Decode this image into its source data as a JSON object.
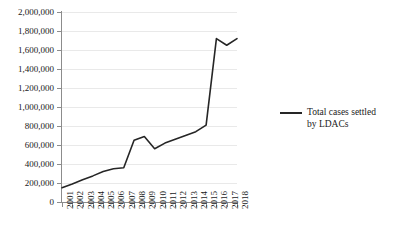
{
  "chart_data": {
    "type": "line",
    "title": "",
    "xlabel": "",
    "ylabel": "",
    "categories": [
      "2001",
      "2002",
      "2003",
      "2004",
      "2005",
      "2006",
      "2007",
      "2008",
      "2009",
      "2010",
      "2011",
      "2012",
      "2013",
      "2014",
      "2015",
      "2016",
      "2017",
      "2018"
    ],
    "series": [
      {
        "name": "Total cases settled by LDACs",
        "color": "#262626",
        "values": [
          150000,
          190000,
          235000,
          275000,
          320000,
          350000,
          360000,
          650000,
          690000,
          560000,
          620000,
          660000,
          700000,
          740000,
          810000,
          1720000,
          1650000,
          1720000
        ]
      }
    ],
    "ylim": [
      0,
      2000000
    ],
    "ytick_values": [
      0,
      200000,
      400000,
      600000,
      800000,
      1000000,
      1200000,
      1400000,
      1600000,
      1800000,
      2000000
    ],
    "ytick_labels": [
      "0",
      "200,000",
      "400,000",
      "600,000",
      "800,000",
      "1,000,000",
      "1,200,000",
      "1,400,000",
      "1,600,000",
      "1,800,000",
      "2,000,000"
    ],
    "grid": true,
    "grid_axis": "y",
    "legend_position": "right"
  },
  "legend": {
    "label_line1": "Total cases settled",
    "label_line2": "by LDACs"
  }
}
